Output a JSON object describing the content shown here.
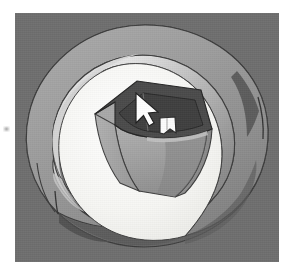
{
  "app": {
    "view_label": "3D Viewport",
    "projection": "perspective",
    "background_color": "#6e6e6e",
    "page_background_color": "#ffffff"
  },
  "canvas": {
    "x": 15,
    "y": 13,
    "width": 264,
    "height": 249
  },
  "scene": {
    "description": "Shaded 3D solid-model view: a large toroidal ring (annulus / washer) lying flat, with an open hexagonal prism box standing inside it.",
    "objects": [
      {
        "id": "torus-ring",
        "name": "Toroidal ring",
        "type": "annulus-solid",
        "center": {
          "x": 130,
          "y": 122
        },
        "outer_radius_x": 122,
        "outer_radius_y": 115,
        "inner_radius_x": 79,
        "inner_radius_y": 74,
        "faces": [
          {
            "id": "ring-top-face",
            "label": "Top face",
            "color": "#9f9f9f"
          },
          {
            "id": "ring-outer-wall",
            "label": "Outer side wall",
            "color": "#7b7b7b"
          },
          {
            "id": "ring-inner-wall",
            "label": "Inner bore wall",
            "color": "#b4b4b4"
          },
          {
            "id": "ring-inner-highlight",
            "label": "Inner wall specular",
            "color": "#d8d8d8"
          },
          {
            "id": "ring-shadow-lower",
            "label": "Lower shadowed band",
            "color": "#5a5a5a"
          },
          {
            "id": "ring-seam",
            "label": "Tangent seam edge",
            "color": "#3a3a3a"
          }
        ]
      },
      {
        "id": "floor-disc",
        "name": "Interior floor disc",
        "type": "disc",
        "color": "#f2f2ef",
        "label": "Bright interior floor"
      },
      {
        "id": "hex-box",
        "name": "Hexagonal prism box",
        "type": "hex-prism-open",
        "center": {
          "x": 120,
          "y": 122
        },
        "faces": [
          {
            "id": "hex-rim-top",
            "label": "Top rim (dark)",
            "color": "#4a4a4a"
          },
          {
            "id": "hex-cavity",
            "label": "Inner cavity",
            "color": "#3f3f3f"
          },
          {
            "id": "hex-face-left",
            "label": "Left side face",
            "color": "#a6a6a6"
          },
          {
            "id": "hex-face-front",
            "label": "Front bulged face",
            "color": "#9a9a9a"
          },
          {
            "id": "hex-face-right",
            "label": "Right side face",
            "color": "#8e8e8e"
          },
          {
            "id": "hex-face-shade",
            "label": "Shaded lower face",
            "color": "#858585"
          }
        ]
      },
      {
        "id": "white-tab",
        "name": "White tab / notch feature",
        "type": "tab",
        "position": {
          "x": 152,
          "y": 113
        },
        "width": 15,
        "height": 17,
        "color": "#fbfbfb"
      }
    ],
    "cursor": {
      "id": "pointer-cursor",
      "label": "Arrow pointer",
      "position": {
        "x": 139,
        "y": 96
      },
      "fill_color": "#ffffff",
      "outline_color": "#1e1e1e"
    }
  }
}
